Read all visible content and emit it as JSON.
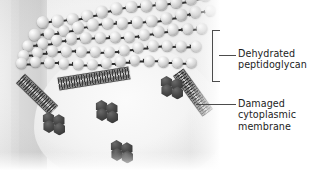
{
  "figure": {
    "background_color": "#ececec",
    "sphere_color": "#cfcfcf",
    "linker_color": "#2e2e2e",
    "hexagon_color": "#3a3a3a",
    "membrane_color": "#6e6e6e",
    "annotation_color": "#4c4c4c",
    "text_color": "#1d1d1d"
  },
  "annotations": [
    {
      "id": "dehydrated-peptidoglycan",
      "label": "Dehydrated\npeptidoglycan",
      "connector": "bracket",
      "bracket": {
        "x": 212,
        "y": 30,
        "width": 7,
        "height": 50
      },
      "leader": {
        "x": 219,
        "y": 55,
        "length": 17
      },
      "text_x": 238,
      "text_y": 48
    },
    {
      "id": "damaged-cytoplasmic-membrane",
      "label": "Damaged\ncytoplasmic\nmembrane",
      "connector": "line",
      "leader": {
        "x": 196,
        "y": 104,
        "length": 40
      },
      "text_x": 238,
      "text_y": 98
    }
  ],
  "structures": {
    "peptidoglycan_rows": [
      {
        "top": 2,
        "left": 36,
        "rotate": -9,
        "count": 12,
        "step": 15.0,
        "size": 11.5
      },
      {
        "top": 16,
        "left": 28,
        "rotate": -7,
        "count": 13,
        "step": 14.8,
        "size": 11.5
      },
      {
        "top": 30,
        "left": 22,
        "rotate": -5,
        "count": 13,
        "step": 14.6,
        "size": 11.2
      },
      {
        "top": 44,
        "left": 18,
        "rotate": -3,
        "count": 13,
        "step": 14.4,
        "size": 11.0
      },
      {
        "top": 57,
        "left": 16,
        "rotate": -1,
        "count": 13,
        "step": 14.2,
        "size": 10.8
      }
    ],
    "membranes": [
      {
        "id": "membrane-left",
        "left": 14,
        "top": 88,
        "width": 46,
        "height": 11,
        "rotate": 44
      },
      {
        "id": "membrane-center",
        "left": 58,
        "top": 72,
        "width": 72,
        "height": 11,
        "rotate": -9
      },
      {
        "id": "membrane-right",
        "left": 168,
        "top": 86,
        "width": 50,
        "height": 11,
        "rotate": 54
      }
    ],
    "hexagon_clusters": [
      {
        "id": "cluster-upper-right",
        "left": 160,
        "top": 76,
        "size": 13
      },
      {
        "id": "cluster-left",
        "left": 42,
        "top": 112,
        "size": 13
      },
      {
        "id": "cluster-center",
        "left": 95,
        "top": 100,
        "size": 13
      },
      {
        "id": "cluster-bottom",
        "left": 110,
        "top": 140,
        "size": 13
      }
    ]
  }
}
